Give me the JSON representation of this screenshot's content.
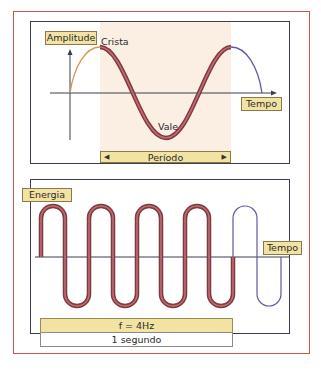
{
  "top_panel": {
    "y_axis_label": "Amplitude",
    "x_axis_label": "Tempo",
    "crest_label": "Crista",
    "trough_label": "Vale",
    "period_label": "Período",
    "period_arrow_left": "◀",
    "period_arrow_right": "▶"
  },
  "bottom_panel": {
    "y_axis_label": "Energia",
    "x_axis_label": "Tempo",
    "frequency_label": "f = 4Hz",
    "duration_label": "1 segundo"
  },
  "colors": {
    "frame": "#d0554c",
    "panel_border": "#3b3e4c",
    "shade": "#fbefe4",
    "label_fill": "#f3e3a3",
    "wave_main": "#a8464d",
    "wave_start": "#e0924a",
    "wave_end": "#5c5aa0"
  }
}
